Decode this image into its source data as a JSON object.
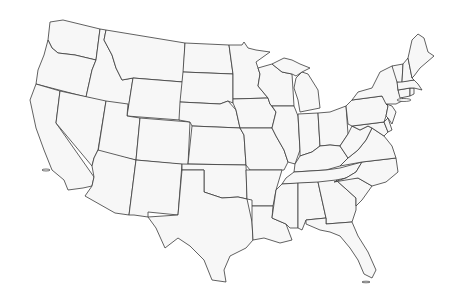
{
  "map": {
    "title": "Contiguous United States — blank state outline map",
    "fill_color": "#f7f7f7",
    "stroke_color": "#3a3a3a",
    "background": "#ffffff",
    "labels_visible": false,
    "states": [
      {
        "id": "WA",
        "name": "Washington"
      },
      {
        "id": "OR",
        "name": "Oregon"
      },
      {
        "id": "CA",
        "name": "California"
      },
      {
        "id": "ID",
        "name": "Idaho"
      },
      {
        "id": "NV",
        "name": "Nevada"
      },
      {
        "id": "MT",
        "name": "Montana"
      },
      {
        "id": "WY",
        "name": "Wyoming"
      },
      {
        "id": "UT",
        "name": "Utah"
      },
      {
        "id": "AZ",
        "name": "Arizona"
      },
      {
        "id": "CO",
        "name": "Colorado"
      },
      {
        "id": "NM",
        "name": "New Mexico"
      },
      {
        "id": "ND",
        "name": "North Dakota"
      },
      {
        "id": "SD",
        "name": "South Dakota"
      },
      {
        "id": "NE",
        "name": "Nebraska"
      },
      {
        "id": "KS",
        "name": "Kansas"
      },
      {
        "id": "OK",
        "name": "Oklahoma"
      },
      {
        "id": "TX",
        "name": "Texas"
      },
      {
        "id": "MN",
        "name": "Minnesota"
      },
      {
        "id": "IA",
        "name": "Iowa"
      },
      {
        "id": "MO",
        "name": "Missouri"
      },
      {
        "id": "AR",
        "name": "Arkansas"
      },
      {
        "id": "LA",
        "name": "Louisiana"
      },
      {
        "id": "WI",
        "name": "Wisconsin"
      },
      {
        "id": "IL",
        "name": "Illinois"
      },
      {
        "id": "MI",
        "name": "Michigan"
      },
      {
        "id": "IN",
        "name": "Indiana"
      },
      {
        "id": "OH",
        "name": "Ohio"
      },
      {
        "id": "KY",
        "name": "Kentucky"
      },
      {
        "id": "TN",
        "name": "Tennessee"
      },
      {
        "id": "MS",
        "name": "Mississippi"
      },
      {
        "id": "AL",
        "name": "Alabama"
      },
      {
        "id": "GA",
        "name": "Georgia"
      },
      {
        "id": "FL",
        "name": "Florida"
      },
      {
        "id": "SC",
        "name": "South Carolina"
      },
      {
        "id": "NC",
        "name": "North Carolina"
      },
      {
        "id": "VA",
        "name": "Virginia"
      },
      {
        "id": "WV",
        "name": "West Virginia"
      },
      {
        "id": "MD",
        "name": "Maryland"
      },
      {
        "id": "DE",
        "name": "Delaware"
      },
      {
        "id": "PA",
        "name": "Pennsylvania"
      },
      {
        "id": "NJ",
        "name": "New Jersey"
      },
      {
        "id": "NY",
        "name": "New York"
      },
      {
        "id": "CT",
        "name": "Connecticut"
      },
      {
        "id": "RI",
        "name": "Rhode Island"
      },
      {
        "id": "MA",
        "name": "Massachusetts"
      },
      {
        "id": "VT",
        "name": "Vermont"
      },
      {
        "id": "NH",
        "name": "New Hampshire"
      },
      {
        "id": "ME",
        "name": "Maine"
      }
    ]
  }
}
